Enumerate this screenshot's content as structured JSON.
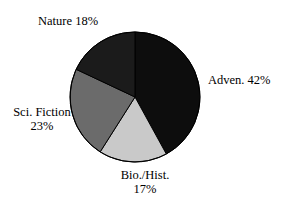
{
  "chart_data": {
    "type": "pie",
    "title": "",
    "subtitle": "",
    "xlabel": "",
    "ylabel": "",
    "legend_position": "none",
    "grid": false,
    "start_angle_deg": 0,
    "direction": "clockwise",
    "categories": [
      "Adven.",
      "Bio./Hist.",
      "Sci. Fiction",
      "Nature"
    ],
    "values": [
      42,
      17,
      23,
      18
    ],
    "units": "%",
    "slices": [
      {
        "name": "Adven.",
        "value": 42,
        "label": "Adven. 42%",
        "label_lines": [
          "Adven. 42%"
        ],
        "color": "#0d0d0d",
        "start_deg": 0,
        "end_deg": 151.2
      },
      {
        "name": "Bio./Hist.",
        "value": 17,
        "label": "Bio./Hist. 17%",
        "label_lines": [
          "Bio./Hist.",
          "17%"
        ],
        "color": "#c9c9c9",
        "start_deg": 151.2,
        "end_deg": 212.4
      },
      {
        "name": "Sci. Fiction",
        "value": 23,
        "label": "Sci. Fiction 23%",
        "label_lines": [
          "Sci. Fiction",
          "23%"
        ],
        "color": "#6b6b6b",
        "start_deg": 212.4,
        "end_deg": 295.2
      },
      {
        "name": "Nature",
        "value": 18,
        "label": "Nature 18%",
        "label_lines": [
          "Nature 18%"
        ],
        "color": "#1b1b1b",
        "start_deg": 295.2,
        "end_deg": 360
      }
    ]
  },
  "labels": {
    "nature": "Nature 18%",
    "adven": "Adven. 42%",
    "scifi_line1": "Sci. Fiction",
    "scifi_line2": "23%",
    "bio_line1": "Bio./Hist.",
    "bio_line2": "17%"
  },
  "colors": {
    "background": "#ffffff",
    "text": "#000000",
    "outline": "#000000",
    "adven": "#0d0d0d",
    "bio": "#c9c9c9",
    "scifi": "#6b6b6b",
    "nature": "#1b1b1b"
  },
  "geometry": {
    "center_x": 135,
    "center_y": 97,
    "radius": 65
  }
}
